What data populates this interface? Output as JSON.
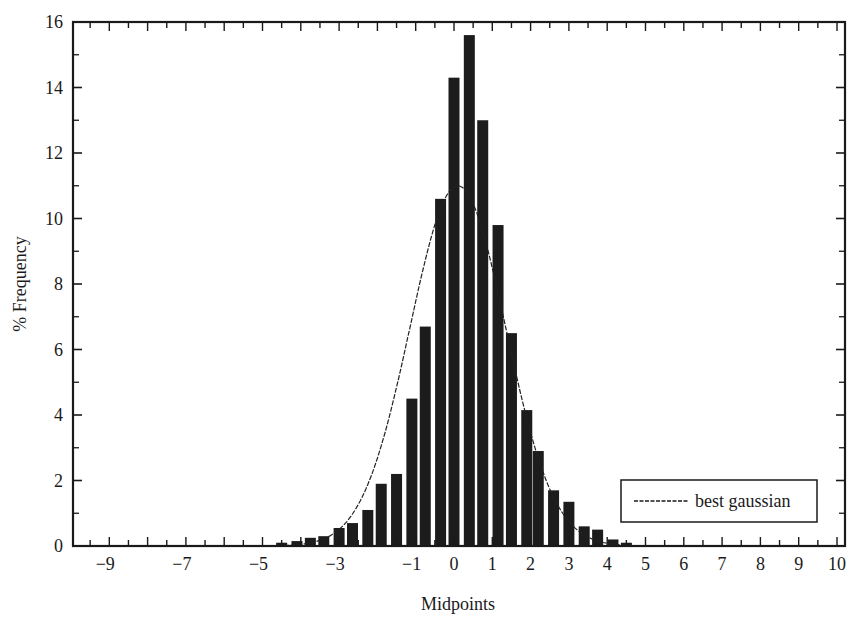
{
  "chart_data": {
    "type": "bar",
    "title": "",
    "xlabel": "Midpoints",
    "ylabel": "% Frequency",
    "xlim": [
      -10,
      10
    ],
    "ylim": [
      0,
      16
    ],
    "x_ticks": [
      -9,
      -7,
      -5,
      -3,
      -1,
      0,
      1,
      2,
      3,
      4,
      5,
      6,
      7,
      8,
      9,
      10
    ],
    "y_ticks": [
      0,
      2,
      4,
      6,
      8,
      10,
      12,
      14,
      16
    ],
    "grid": false,
    "legend": {
      "position": "lower right",
      "entries": [
        "best gaussian"
      ]
    },
    "series": [
      {
        "name": "histogram",
        "type": "bar",
        "x": [
          -4.5,
          -4.1,
          -3.75,
          -3.4,
          -3.0,
          -2.65,
          -2.25,
          -1.9,
          -1.5,
          -1.1,
          -0.75,
          -0.35,
          0.0,
          0.4,
          0.75,
          1.15,
          1.5,
          1.9,
          2.2,
          2.6,
          3.0,
          3.4,
          3.75,
          4.15,
          4.5
        ],
        "values": [
          0.1,
          0.15,
          0.25,
          0.3,
          0.55,
          0.7,
          1.1,
          1.9,
          2.2,
          4.5,
          6.7,
          10.6,
          14.3,
          15.6,
          13.0,
          9.8,
          6.5,
          4.15,
          2.9,
          1.7,
          1.35,
          0.6,
          0.5,
          0.2,
          0.1
        ]
      },
      {
        "name": "best gaussian",
        "type": "line",
        "mean": 0.1,
        "sigma": 1.25,
        "peak": 11.0
      }
    ]
  }
}
